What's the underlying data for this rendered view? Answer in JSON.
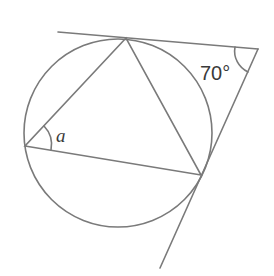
{
  "diagram": {
    "type": "circle-geometry",
    "labels": {
      "external_angle": "70°",
      "inscribed_angle": "a"
    },
    "colors": {
      "line": "#7a7a7a",
      "text": "#3a3a3a",
      "background": "#ffffff"
    },
    "circle": {
      "cx": 118,
      "cy": 133,
      "r": 94
    },
    "triangle": {
      "top": [
        126,
        38
      ],
      "left": [
        25,
        146
      ],
      "right": [
        201,
        175
      ]
    },
    "tangents": {
      "external_point": [
        258,
        49
      ],
      "line1_start": [
        58,
        32
      ],
      "line2_end": [
        160,
        268
      ]
    }
  }
}
